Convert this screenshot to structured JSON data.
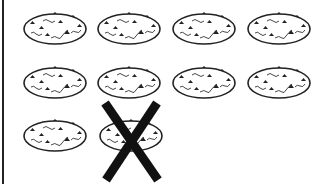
{
  "figure": {
    "rows": [
      {
        "pizzas": [
          {
            "crossed": false
          },
          {
            "crossed": false
          },
          {
            "crossed": false
          },
          {
            "crossed": false
          }
        ]
      },
      {
        "pizzas": [
          {
            "crossed": false
          },
          {
            "crossed": false
          },
          {
            "crossed": false
          },
          {
            "crossed": false
          }
        ]
      },
      {
        "pizzas": [
          {
            "crossed": false
          },
          {
            "crossed": true
          }
        ]
      }
    ],
    "total_pizzas": 10,
    "crossed_out_count": 1,
    "colors": {
      "stroke": "#222222",
      "background": "#ffffff"
    }
  }
}
